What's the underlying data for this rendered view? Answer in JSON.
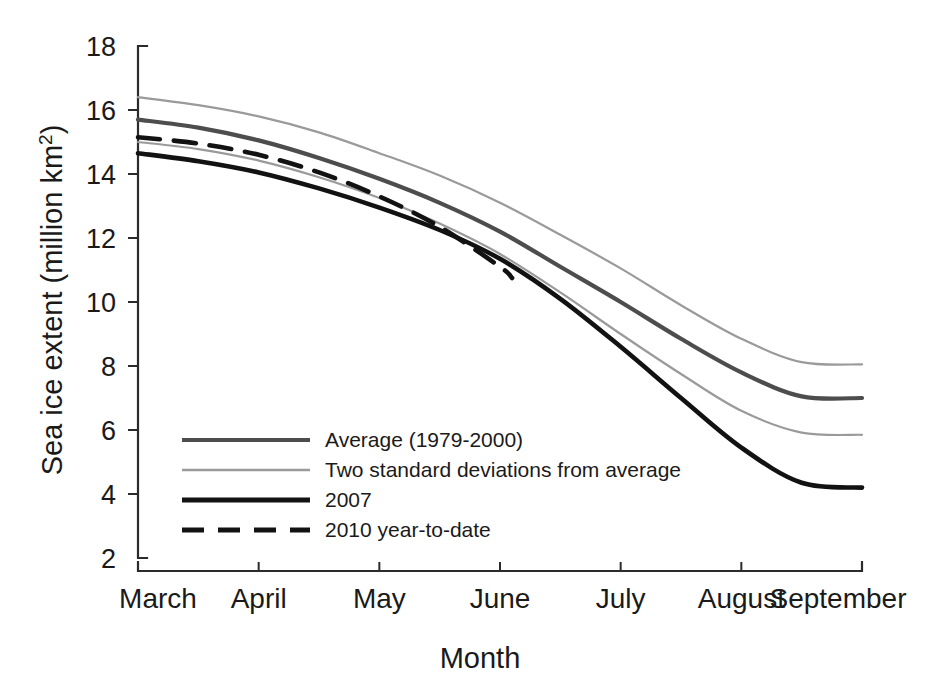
{
  "chart_data": {
    "type": "line",
    "title": "",
    "xlabel": "Month",
    "ylabel": "Sea ice extent (million km 2)",
    "ylabel_main": "Sea ice extent (million km",
    "ylabel_sup": "2",
    "ylabel_close": ")",
    "xlim": [
      0,
      6
    ],
    "ylim": [
      2,
      18
    ],
    "grid": false,
    "legend_position": "inside lower-left",
    "categories": [
      "March",
      "April",
      "May",
      "June",
      "July",
      "August",
      "September"
    ],
    "xticklabels": [
      "March",
      "April",
      "May",
      "June",
      "July",
      "August",
      "September"
    ],
    "yticklabels": [
      "18",
      "16",
      "14",
      "12",
      "10",
      "8",
      "6",
      "4",
      "2"
    ],
    "ytickvalues": [
      18,
      16,
      14,
      12,
      10,
      8,
      6,
      4,
      2
    ],
    "series": [
      {
        "name": "Average (1979-2000)",
        "color": "#4d4d4d",
        "width": 4.2,
        "dash": "none",
        "x": [
          0,
          0.5,
          1,
          1.5,
          2,
          2.5,
          3,
          3.5,
          4,
          4.5,
          5,
          5.5,
          6
        ],
        "values": [
          15.7,
          15.45,
          15.05,
          14.5,
          13.85,
          13.1,
          12.2,
          11.1,
          10.0,
          8.85,
          7.8,
          7.05,
          7.0
        ]
      },
      {
        "name": "Two standard deviations from average",
        "color": "#9a9a9a",
        "width": 2.2,
        "dash": "none",
        "x": [
          0,
          0.5,
          1,
          1.5,
          2,
          2.5,
          3,
          3.5,
          4,
          4.5,
          5,
          5.5,
          6
        ],
        "values": [
          16.4,
          16.15,
          15.8,
          15.3,
          14.65,
          13.95,
          13.1,
          12.1,
          11.05,
          9.9,
          8.85,
          8.12,
          8.05
        ],
        "band": "upper"
      },
      {
        "name": "Two standard deviations from average",
        "color": "#9a9a9a",
        "width": 2.2,
        "dash": "none",
        "x": [
          0,
          0.5,
          1,
          1.5,
          2,
          2.5,
          3,
          3.5,
          4,
          4.5,
          5,
          5.5,
          6
        ],
        "values": [
          15.0,
          14.78,
          14.42,
          13.9,
          13.25,
          12.45,
          11.5,
          10.3,
          9.0,
          7.75,
          6.6,
          5.92,
          5.85
        ],
        "band": "lower"
      },
      {
        "name": "2007",
        "color": "#121212",
        "width": 4.6,
        "dash": "none",
        "x": [
          0,
          0.5,
          1,
          1.5,
          2,
          2.5,
          3,
          3.5,
          4,
          4.5,
          5,
          5.5,
          6
        ],
        "values": [
          14.65,
          14.4,
          14.05,
          13.55,
          12.95,
          12.25,
          11.35,
          10.1,
          8.6,
          7.0,
          5.45,
          4.35,
          4.2
        ]
      },
      {
        "name": "2010 year-to-date",
        "color": "#121212",
        "width": 4.6,
        "dash": "22,14",
        "x": [
          0,
          0.5,
          1,
          1.5,
          2,
          2.5,
          3,
          3.1
        ],
        "values": [
          15.15,
          14.95,
          14.6,
          14.05,
          13.3,
          12.35,
          11.1,
          10.75
        ]
      }
    ],
    "legend": [
      {
        "label": "Average (1979-2000)",
        "color": "#4d4d4d",
        "width": 4.2,
        "dash": "none"
      },
      {
        "label": "Two standard deviations from average",
        "color": "#9a9a9a",
        "width": 2.4,
        "dash": "none"
      },
      {
        "label": "2007",
        "color": "#121212",
        "width": 5.0,
        "dash": "none"
      },
      {
        "label": "2010 year-to-date",
        "color": "#121212",
        "width": 5.0,
        "dash": "22,14"
      }
    ]
  }
}
